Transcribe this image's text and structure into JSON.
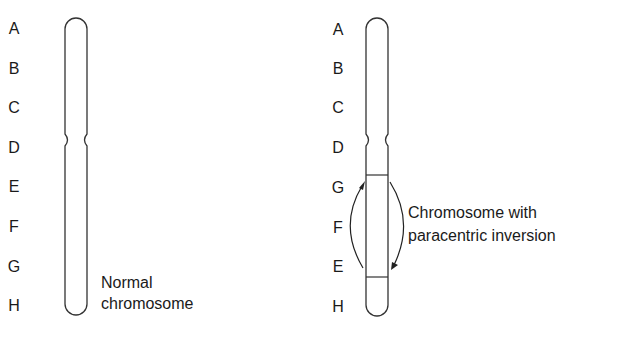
{
  "normal": {
    "labels": [
      "A",
      "B",
      "C",
      "D",
      "E",
      "F",
      "G",
      "H"
    ],
    "caption_line1": "Normal",
    "caption_line2": "chromosome"
  },
  "inverted": {
    "labels": [
      "A",
      "B",
      "C",
      "D",
      "G",
      "F",
      "E",
      "H"
    ],
    "caption_line1": "Chromosome with",
    "caption_line2": "paracentric inversion"
  },
  "colors": {
    "line": "#333333",
    "text": "#1a1a1a",
    "background": "#ffffff"
  }
}
